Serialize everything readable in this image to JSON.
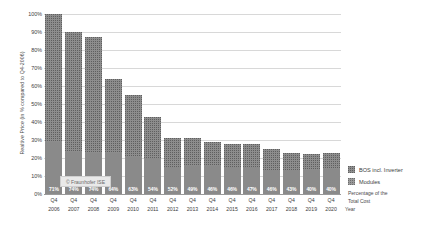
{
  "chart_data": {
    "type": "bar",
    "subtype": "stacked-bar",
    "title": "",
    "xlabel": "Year",
    "ylabel": "Realtive Price (in % compared to Q4-2006)",
    "ylim": [
      0,
      100
    ],
    "grid": true,
    "legend_position": "right",
    "categories": [
      "Q4 2006",
      "Q4 2007",
      "Q4 2008",
      "Q4 2009",
      "Q4 2010",
      "Q4 2011",
      "Q4 2012",
      "Q4 2013",
      "Q4 2014",
      "Q4 2015",
      "Q4 2016",
      "Q4 2017",
      "Q4 2018",
      "Q4 2019",
      "Q4 2020"
    ],
    "x_quarter_labels": [
      "Q4",
      "Q4",
      "Q4",
      "Q4",
      "Q4",
      "Q4",
      "Q4",
      "Q4",
      "Q4",
      "Q4",
      "Q4",
      "Q4",
      "Q4",
      "Q4",
      "Q4"
    ],
    "x_year_labels": [
      "2006",
      "2007",
      "2008",
      "2009",
      "2010",
      "2011",
      "2012",
      "2013",
      "2014",
      "2015",
      "2016",
      "2017",
      "2018",
      "2019",
      "2020"
    ],
    "ytick_labels": [
      "100%",
      "90%",
      "80%",
      "70%",
      "60%",
      "50%",
      "40%",
      "30%",
      "20%",
      "10%",
      "0%"
    ],
    "ytick_values": [
      100,
      90,
      80,
      70,
      60,
      50,
      40,
      30,
      20,
      10,
      0
    ],
    "totals": [
      100,
      90,
      87,
      64,
      55,
      43,
      31,
      31,
      29,
      28,
      28,
      25,
      23,
      22,
      23
    ],
    "series": [
      {
        "name": "Modules",
        "values": [
          71.0,
          66.6,
          64.4,
          41.0,
          34.7,
          23.2,
          16.1,
          15.2,
          13.3,
          12.9,
          13.2,
          11.5,
          9.9,
          8.8,
          9.2
        ]
      },
      {
        "name": "BOS incl. Inverter",
        "values": [
          29.0,
          23.4,
          22.6,
          23.0,
          20.3,
          19.8,
          14.9,
          15.8,
          15.7,
          15.1,
          14.8,
          13.5,
          13.1,
          13.2,
          13.8
        ]
      }
    ],
    "bar_labels": [
      "71%",
      "74%",
      "74%",
      "64%",
      "63%",
      "54%",
      "52%",
      "49%",
      "46%",
      "46%",
      "47%",
      "46%",
      "43%",
      "40%",
      "40%"
    ],
    "bar_label_meaning": "Percentage of the Total Cost"
  },
  "legend": {
    "items": [
      {
        "label": "BOS incl. Inverter",
        "swatch": "sw-bos"
      },
      {
        "label": "Modules",
        "swatch": "sw-mod"
      }
    ],
    "caption_line1": "Percentage of the",
    "caption_line2": "Total Cost"
  },
  "watermark": {
    "text": "© Fraunhofer ISE"
  },
  "colors": {
    "modules": "#8d8d8d",
    "bos": "#8a8a8a",
    "grid": "#d8d8d8",
    "axis": "#9a9a9a",
    "label_text": "#ffffff"
  }
}
